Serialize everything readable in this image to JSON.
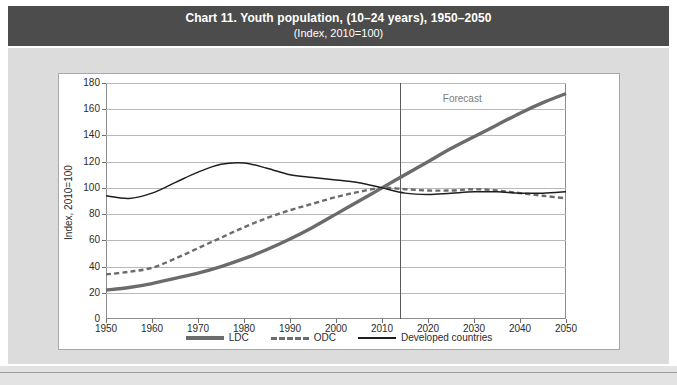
{
  "header": {
    "title": "Chart 11. Youth population, (10–24 years), 1950–2050",
    "subtitle": "(Index, 2010=100)",
    "bar_color": "#4c4c4c"
  },
  "annotations": {
    "forecast_label": "Forecast",
    "forecast_start_year": 2014
  },
  "footer": {
    "cut_text": ""
  },
  "legend": {
    "position": "bottom-center",
    "items": [
      {
        "label": "LDC",
        "style": "thick-solid",
        "color": "#6b6b6b"
      },
      {
        "label": "ODC",
        "style": "dashed",
        "color": "#6b6b6b"
      },
      {
        "label": "Developed countries",
        "style": "thin-solid",
        "color": "#1e1e1e"
      }
    ]
  },
  "chart_data": {
    "type": "line",
    "title": "Chart 11. Youth population, (10–24 years), 1950–2050",
    "subtitle": "(Index, 2010=100)",
    "xlabel": "",
    "ylabel": "Index, 2010=100",
    "xlim": [
      1950,
      2050
    ],
    "ylim": [
      0,
      180
    ],
    "ytick_values": [
      0,
      20,
      40,
      60,
      80,
      100,
      120,
      140,
      160,
      180
    ],
    "xtick_values": [
      1950,
      1960,
      1970,
      1980,
      1990,
      2000,
      2010,
      2020,
      2030,
      2040,
      2050
    ],
    "grid": "horizontal",
    "legend_position": "bottom-center",
    "annotations": [
      {
        "text": "Forecast",
        "x": 2028,
        "y": 168
      },
      {
        "type": "vline",
        "x": 2014
      }
    ],
    "x": [
      1950,
      1955,
      1960,
      1965,
      1970,
      1975,
      1980,
      1985,
      1990,
      1995,
      2000,
      2005,
      2010,
      2015,
      2020,
      2025,
      2030,
      2035,
      2040,
      2045,
      2050
    ],
    "series": [
      {
        "name": "LDC",
        "style": "thick-solid",
        "color": "#6b6b6b",
        "values": [
          22,
          24,
          27,
          31,
          35,
          40,
          46,
          53,
          61,
          70,
          80,
          90,
          100,
          110,
          120,
          130,
          139,
          148,
          157,
          165,
          172
        ]
      },
      {
        "name": "ODC",
        "style": "dashed",
        "color": "#6b6b6b",
        "values": [
          34,
          36,
          39,
          46,
          54,
          62,
          70,
          77,
          83,
          88,
          93,
          97,
          100,
          99,
          98,
          98,
          99,
          98,
          96,
          94,
          92
        ]
      },
      {
        "name": "Developed countries",
        "style": "thin-solid",
        "color": "#1e1e1e",
        "values": [
          94,
          92,
          96,
          104,
          112,
          118,
          119,
          115,
          110,
          108,
          106,
          104,
          100,
          96,
          95,
          96,
          97,
          97,
          96,
          96,
          97
        ]
      }
    ]
  }
}
